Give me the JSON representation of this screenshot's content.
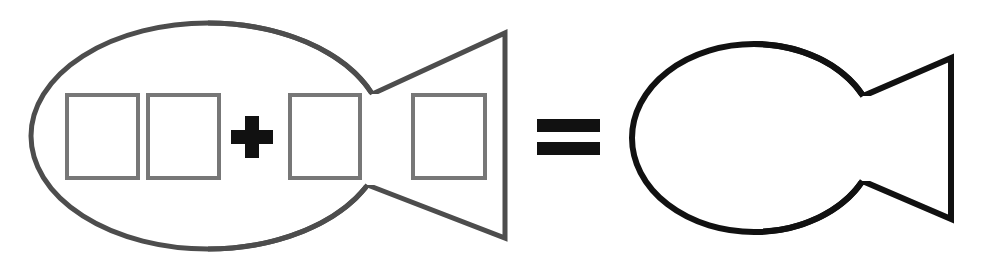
{
  "page": {
    "title": "Fish puzzle equation",
    "background_color": "#ffffff",
    "width": 982,
    "height": 262
  },
  "equation": {
    "description": "A large fish outline containing four empty rectangles and a plus sign equals a plain fish outline",
    "plus_symbol": "+",
    "equals_symbol": "=",
    "plus_label": "plus",
    "equals_label": "equals"
  },
  "colors": {
    "left_fish_stroke": "#4d4d4d",
    "rectangle_stroke": "#777777",
    "operator_fill": "#111111",
    "right_fish_stroke": "#111111",
    "shape_fill": "none",
    "background": "#ffffff"
  },
  "left_fish": {
    "name": "fish-with-rectangles",
    "stroke_width": 5,
    "body": {
      "cx": 208,
      "cy": 136,
      "rx": 177,
      "ry": 113
    },
    "tail": {
      "junction_x": 385,
      "upper_notch_y": 94,
      "lower_notch_y": 185,
      "tip_x": 505,
      "tip_top_y": 33,
      "tip_bottom_y": 238
    },
    "rectangles": [
      {
        "label": "rectangle-1",
        "x": 67,
        "y": 95,
        "w": 71,
        "h": 83
      },
      {
        "label": "rectangle-2",
        "x": 148,
        "y": 95,
        "w": 71,
        "h": 83
      },
      {
        "label": "rectangle-3",
        "x": 290,
        "y": 95,
        "w": 70,
        "h": 83
      },
      {
        "label": "rectangle-4",
        "x": 413,
        "y": 95,
        "w": 72,
        "h": 83
      }
    ],
    "plus": {
      "cx": 252,
      "cy": 137,
      "arm_length": 42,
      "arm_thickness": 14
    }
  },
  "operator": {
    "equals": {
      "x": 537,
      "width": 63,
      "bar_height": 13,
      "top_bar_y": 119,
      "bottom_bar_y": 142
    }
  },
  "right_fish": {
    "name": "plain-fish",
    "stroke_width": 6,
    "body": {
      "cx": 754,
      "cy": 138,
      "rx": 122,
      "ry": 94
    },
    "tail": {
      "junction_x": 876,
      "upper_notch_y": 96,
      "lower_notch_y": 181,
      "tip_x": 951,
      "tip_top_y": 58,
      "tip_bottom_y": 219
    }
  }
}
